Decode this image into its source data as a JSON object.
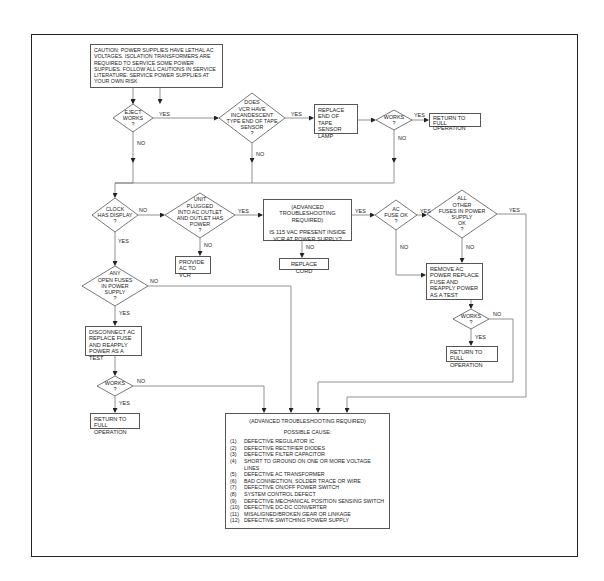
{
  "flowchart": {
    "caution": "CAUTION: POWER SUPPLIES HAVE LETHAL AC VOLTAGES. ISOLATION TRANSFORMERS ARE REQUIRED TO SERVICE SOME POWER SUPPLIES. FOLLOW ALL CAUTIONS IN SERVICE LITERATURE. SERVICE POWER SUPPLIES AT YOUR OWN RISK",
    "decisions": {
      "eject_works": [
        "EJECT",
        "WORKS",
        "?"
      ],
      "incandescent_sensor": [
        "DOES",
        "VCR HAVE",
        "INCANDESCENT",
        "TYPE END OF TAPE",
        "SENSOR",
        "?"
      ],
      "works_1": [
        "WORKS",
        "?"
      ],
      "clock_display": [
        "CLOCK",
        "HAS DISPLAY",
        "?"
      ],
      "unit_plugged": [
        "UNIT",
        "PLUGGED",
        "INTO AC OUTLET",
        "AND OUTLET HAS",
        "POWER",
        "?"
      ],
      "ac_fuse_ok": [
        "AC",
        "FUSE OK",
        "?"
      ],
      "all_other_fuses": [
        "ALL",
        "OTHER",
        "FUSES IN POWER",
        "SUPPLY",
        "OK",
        "?"
      ],
      "works_2": [
        "WORKS",
        "?"
      ],
      "any_open_fuses": [
        "ANY",
        "OPEN FUSES",
        "IN POWER",
        "SUPPLY",
        "?"
      ],
      "works_3": [
        "WORKS",
        "?"
      ]
    },
    "actions": {
      "replace_lamp": "REPLACE END OF TAPE SENSOR LAMP",
      "return_full_1": "RETURN TO FULL OPERATION",
      "provide_ac": "PROVIDE AC TO VCR",
      "advanced_115": {
        "line1": "(ADVANCED TROUBLESHOOTING REQUIRED)",
        "line2": "IS 115 VAC PRESENT INSIDE VCR AT POWER SUPPLY?"
      },
      "replace_cord": "REPLACE CORD",
      "remove_ac_power": "REMOVE AC POWER REPLACE FUSE AND REAPPLY POWER AS A TEST",
      "return_full_2": "RETURN TO FULL OPERATION",
      "disconnect_ac": "DISCONNECT AC REPLACE FUSE AND REAPPLY POWER AS A TEST",
      "return_full_3": "RETURN TO FULL OPERATION"
    },
    "final": {
      "heading": "(ADVANCED TROUBLESHOOTING REQUIRED)",
      "subheading": "POSSIBLE CAUSE:",
      "causes": [
        {
          "num": "(1)",
          "text": "DEFECTIVE REGULATOR IC"
        },
        {
          "num": "(2)",
          "text": "DEFECTIVE RECTIFIER DIODES"
        },
        {
          "num": "(3)",
          "text": "DEFECTIVE FILTER CAPACITOR"
        },
        {
          "num": "(4)",
          "text": "SHORT TO GROUND ON ONE OR MORE VOLTAGE LINES"
        },
        {
          "num": "(5)",
          "text": "DEFECTIVE AC TRANSFORMER"
        },
        {
          "num": "(6)",
          "text": "BAD CONNECTION, SOLDER TRACE OR WIRE"
        },
        {
          "num": "(7)",
          "text": "DEFECTIVE ON/OFF POWER SWITCH"
        },
        {
          "num": "(8)",
          "text": "SYSTEM CONTROL DEFECT"
        },
        {
          "num": "(9)",
          "text": "DEFECTIVE MECHANICAL POSITION SENSING SWITCH"
        },
        {
          "num": "(10)",
          "text": "DEFECTIVE DC-DC CONVERTER"
        },
        {
          "num": "(11)",
          "text": "MISALIGNED/BROKEN GEAR OR LINKAGE"
        },
        {
          "num": "(12)",
          "text": "DEFECTIVE SWITCHING POWER SUPPLY"
        }
      ]
    },
    "labels": {
      "yes": "YES",
      "no": "NO"
    }
  }
}
